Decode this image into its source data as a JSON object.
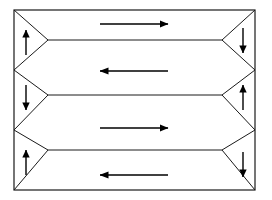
{
  "canvas": {
    "width": 272,
    "height": 200,
    "background": "#ffffff"
  },
  "diagram": {
    "type": "serpentine-flow",
    "stroke_color": "#1a1a1a",
    "arrow_color": "#000000",
    "border_stroke_width": 1.2,
    "divider_stroke_width": 1.0,
    "arrow_stroke_width": 1.4
  },
  "border": {
    "label": "outer-rectangle",
    "left": 14,
    "top": 10,
    "right": 255,
    "bottom": 190
  },
  "geometry": {
    "left_apex_x": 48,
    "right_apex_x": 222,
    "divider_ys": [
      40,
      95,
      150
    ],
    "vertex_ys": [
      10,
      70,
      130,
      190
    ]
  },
  "dividers": [
    {
      "name": "divider-upper",
      "flat_y": 40,
      "left_vertex_y": 10,
      "left_apex_y": 40,
      "left_vertex2_y": 70,
      "right_vertex_y": 10,
      "right_apex_y": 40,
      "right_vertex2_y": 70
    },
    {
      "name": "divider-middle",
      "flat_y": 95,
      "left_vertex_y": 70,
      "left_apex_y": 95,
      "left_vertex2_y": 130,
      "right_vertex_y": 70,
      "right_apex_y": 95,
      "right_vertex2_y": 130
    },
    {
      "name": "divider-lower",
      "flat_y": 150,
      "left_vertex_y": 130,
      "left_apex_y": 150,
      "left_vertex2_y": 190,
      "right_vertex_y": 130,
      "right_apex_y": 150,
      "right_vertex2_y": 190
    }
  ],
  "lanes": [
    {
      "index": 0,
      "name": "lane-1",
      "direction": "right",
      "arrow_label": "flow-right-1",
      "y": 24,
      "x_start": 100,
      "x_end": 168
    },
    {
      "index": 1,
      "name": "lane-2",
      "direction": "left",
      "arrow_label": "flow-left-1",
      "y": 71,
      "x_start": 168,
      "x_end": 100
    },
    {
      "index": 2,
      "name": "lane-3",
      "direction": "right",
      "arrow_label": "flow-right-2",
      "y": 128,
      "x_start": 100,
      "x_end": 168
    },
    {
      "index": 3,
      "name": "lane-4",
      "direction": "left",
      "arrow_label": "flow-left-2",
      "y": 175,
      "x_start": 168,
      "x_end": 100
    }
  ],
  "turn_arrows": [
    {
      "name": "turn-left-up-1",
      "side": "left",
      "direction": "up",
      "x": 26,
      "y_tail": 55,
      "y_head": 30
    },
    {
      "name": "turn-left-down-1",
      "side": "left",
      "direction": "down",
      "x": 26,
      "y_tail": 85,
      "y_head": 110
    },
    {
      "name": "turn-left-up-2",
      "side": "left",
      "direction": "up",
      "x": 26,
      "y_tail": 175,
      "y_head": 150
    },
    {
      "name": "turn-right-down-1",
      "side": "right",
      "direction": "down",
      "x": 243,
      "y_tail": 28,
      "y_head": 53
    },
    {
      "name": "turn-right-up-1",
      "side": "right",
      "direction": "up",
      "x": 243,
      "y_tail": 110,
      "y_head": 85
    },
    {
      "name": "turn-right-down-2",
      "side": "right",
      "direction": "down",
      "x": 243,
      "y_tail": 152,
      "y_head": 177
    }
  ]
}
